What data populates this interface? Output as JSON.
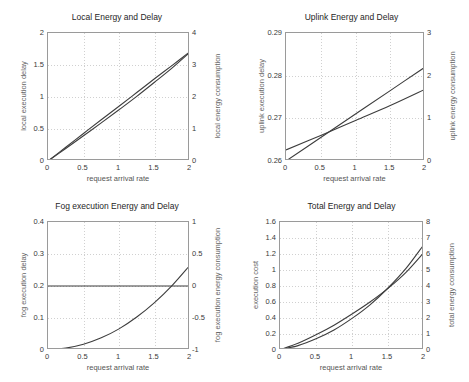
{
  "figure": {
    "xlabel_common": "request arrival rate"
  },
  "chart_data": [
    {
      "id": "local",
      "type": "line",
      "title": "Local Energy and Delay",
      "xlabel": "request arrival rate",
      "ylabel": "local execution delay",
      "ylabel_right": "local energy consumption",
      "xlim": [
        0,
        2
      ],
      "ylim": [
        0,
        2
      ],
      "ylim_right": [
        0,
        4
      ],
      "xticks": [
        0,
        0.5,
        1,
        1.5,
        2
      ],
      "xticklabels": [
        "0",
        "0.5",
        "1",
        "1.5",
        "2"
      ],
      "yticks": [
        0,
        0.5,
        1,
        1.5,
        2
      ],
      "yticklabels": [
        "0",
        "0.5",
        "1",
        "1.5",
        "2"
      ],
      "yticks_right": [
        0,
        1,
        2,
        3,
        4
      ],
      "yticklabels_right": [
        "0",
        "1",
        "2",
        "3",
        "4"
      ],
      "grid": true,
      "legend": "none",
      "series": [
        {
          "name": "local execution delay",
          "axis": "left",
          "x": [
            0,
            0.25,
            0.5,
            0.75,
            1,
            1.25,
            1.5,
            1.75,
            2
          ],
          "values": [
            0,
            0.215,
            0.43,
            0.645,
            0.855,
            1.07,
            1.285,
            1.495,
            1.71
          ]
        },
        {
          "name": "local energy consumption",
          "axis": "right",
          "x": [
            0,
            0.25,
            0.5,
            0.75,
            1,
            1.25,
            1.5,
            1.75,
            2
          ],
          "values": [
            0,
            0.39,
            0.79,
            1.19,
            1.6,
            2.02,
            2.46,
            2.91,
            3.4
          ]
        }
      ]
    },
    {
      "id": "uplink",
      "type": "line",
      "title": "Uplink Energy and Delay",
      "xlabel": "request arrival rate",
      "ylabel": "uplink execution delay",
      "ylabel_right": "uplink energy consumption",
      "xlim": [
        0,
        2
      ],
      "ylim": [
        0.26,
        0.29
      ],
      "ylim_right": [
        0,
        3
      ],
      "xticks": [
        0,
        0.5,
        1,
        1.5,
        2
      ],
      "xticklabels": [
        "0",
        "0.5",
        "1",
        "1.5",
        "2"
      ],
      "yticks": [
        0.26,
        0.27,
        0.28,
        0.29
      ],
      "yticklabels": [
        "0.26",
        "0.27",
        "0.28",
        "0.29"
      ],
      "yticks_right": [
        0,
        1,
        2,
        3
      ],
      "yticklabels_right": [
        "0",
        "1",
        "2",
        "3"
      ],
      "grid": true,
      "legend": "none",
      "series": [
        {
          "name": "uplink execution delay",
          "axis": "left",
          "x": [
            0,
            0.5,
            1,
            1.5,
            2
          ],
          "values": [
            0.26,
            0.2655,
            0.271,
            0.2765,
            0.282
          ]
        },
        {
          "name": "uplink energy consumption",
          "axis": "right",
          "x": [
            0,
            0.5,
            1,
            1.5,
            2
          ],
          "values": [
            0.26,
            0.6,
            0.95,
            1.3,
            1.68
          ]
        }
      ]
    },
    {
      "id": "fog",
      "type": "line",
      "title": "Fog execution Energy and Delay",
      "xlabel": "request arrival rate",
      "ylabel": "fog execution delay",
      "ylabel_right": "fog execution energy consumption",
      "xlim": [
        0,
        2
      ],
      "ylim": [
        0,
        0.4
      ],
      "ylim_right": [
        -1,
        1
      ],
      "xticks": [
        0,
        0.5,
        1,
        1.5,
        2
      ],
      "xticklabels": [
        "0",
        "0.5",
        "1",
        "1.5",
        "2"
      ],
      "yticks": [
        0,
        0.1,
        0.2,
        0.3,
        0.4
      ],
      "yticklabels": [
        "0",
        "0.1",
        "0.2",
        "0.3",
        "0.4"
      ],
      "yticks_right": [
        -1,
        -0.5,
        0,
        0.5,
        1
      ],
      "yticklabels_right": [
        "-1",
        "-0.5",
        "0",
        "0.5",
        "1"
      ],
      "grid": true,
      "legend": "none",
      "series": [
        {
          "name": "fog execution energy consumption",
          "axis": "right",
          "x": [
            0,
            2
          ],
          "values": [
            0,
            0
          ]
        },
        {
          "name": "fog execution delay",
          "axis": "left",
          "x": [
            0,
            0.25,
            0.5,
            0.75,
            1,
            1.25,
            1.5,
            1.75,
            2
          ],
          "values": [
            0.002,
            0.006,
            0.018,
            0.038,
            0.066,
            0.103,
            0.148,
            0.202,
            0.265
          ]
        }
      ]
    },
    {
      "id": "total",
      "type": "line",
      "title": "Total Energy and Delay",
      "xlabel": "request arrival rate",
      "ylabel": "execution cost",
      "ylabel_right": "total energy consumption",
      "xlim": [
        0,
        2
      ],
      "ylim": [
        0,
        1.6
      ],
      "ylim_right": [
        0,
        8
      ],
      "xticks": [
        0,
        0.5,
        1,
        1.5,
        2
      ],
      "xticklabels": [
        "0",
        "0.5",
        "1",
        "1.5",
        "2"
      ],
      "yticks": [
        0,
        0.2,
        0.4,
        0.6,
        0.8,
        1,
        1.2,
        1.4,
        1.6
      ],
      "yticklabels": [
        "0",
        "0.2",
        "0.4",
        "0.6",
        "0.8",
        "1",
        "1.2",
        "1.4",
        "1.6"
      ],
      "yticks_right": [
        0,
        1,
        2,
        3,
        4,
        5,
        6,
        7,
        8
      ],
      "yticklabels_right": [
        "0",
        "1",
        "2",
        "3",
        "4",
        "5",
        "6",
        "7",
        "8"
      ],
      "grid": true,
      "legend": "none",
      "series": [
        {
          "name": "execution cost",
          "axis": "left",
          "x": [
            0,
            0.25,
            0.5,
            0.75,
            1,
            1.25,
            1.5,
            1.75,
            2
          ],
          "values": [
            0.005,
            0.055,
            0.14,
            0.25,
            0.395,
            0.565,
            0.775,
            1.02,
            1.32
          ]
        },
        {
          "name": "total energy consumption",
          "axis": "right",
          "x": [
            0,
            0.25,
            0.5,
            0.75,
            1,
            1.25,
            1.5,
            1.75,
            2
          ],
          "values": [
            0.02,
            0.42,
            0.95,
            1.55,
            2.25,
            3.0,
            3.85,
            4.85,
            6.1
          ]
        }
      ]
    }
  ]
}
